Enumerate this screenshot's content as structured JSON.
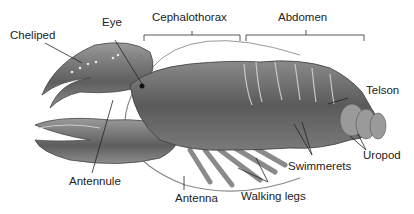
{
  "diagram": {
    "labels": {
      "cheliped": "Cheliped",
      "eye": "Eye",
      "cephalothorax": "Cephalothorax",
      "abdomen": "Abdomen",
      "telson": "Telson",
      "antennule": "Antennule",
      "antenna": "Antenna",
      "walking_legs": "Walking legs",
      "swimmerets": "Swimmerets",
      "uropod": "Uropod"
    },
    "colors": {
      "body_dark": "#4a4a4a",
      "body_mid": "#6e6e6e",
      "body_light": "#a8a8a8",
      "line": "#333333",
      "background": "#ffffff"
    }
  }
}
